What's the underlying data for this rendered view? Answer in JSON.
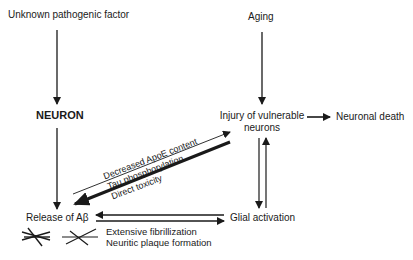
{
  "diagram": {
    "nodes": {
      "unknown_factor": "Unknown pathogenic factor",
      "neuron": "NEURON",
      "aging": "Aging",
      "injury_line1": "Injury of vulnerable",
      "injury_line2": "neurons",
      "neuronal_death": "Neuronal death",
      "release_abeta": "Release of Aβ",
      "glial_activation": "Glial activation"
    },
    "edge_labels": {
      "abeta_to_injury": [
        "Decreased ApoE content",
        "Tau phosphorylation",
        "Direct toxicity"
      ],
      "abeta_aggregation": [
        "Extensive fibrillization",
        "Neuritic plaque formation"
      ]
    },
    "symbols": {
      "crossed_lines_1": "fibril-cross-symbol",
      "crossed_lines_2": "fibril-cross-symbol"
    },
    "colors": {
      "line": "#1a1a1a",
      "background": "#ffffff"
    }
  }
}
